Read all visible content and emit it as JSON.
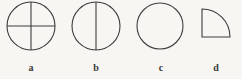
{
  "figure_set": {
    "background_color": "#f7f6f3",
    "stroke_color": "#3d3d3d",
    "label_color": "#3a3a3a",
    "figures": [
      {
        "id": "a",
        "label": "a",
        "shape": "circle-quartered",
        "description": "circle divided by a vertical diameter and a horizontal diameter into four quarters",
        "divider_count": 2
      },
      {
        "id": "b",
        "label": "b",
        "shape": "circle-halved",
        "description": "circle divided by a single vertical diameter into two halves",
        "divider_count": 1
      },
      {
        "id": "c",
        "label": "c",
        "shape": "circle-plain",
        "description": "plain circle with no internal dividing lines",
        "divider_count": 0
      },
      {
        "id": "d",
        "label": "d",
        "shape": "quarter-circle",
        "description": "quarter circle sector with the right angle at the bottom-left, arc sweeping from top-left to bottom-right",
        "divider_count": 0
      }
    ]
  }
}
